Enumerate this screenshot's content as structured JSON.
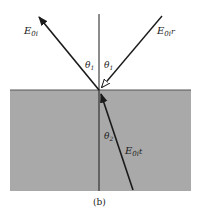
{
  "diagram": {
    "labels": {
      "incident": {
        "main": "E",
        "sub": "0i"
      },
      "reflected": {
        "main": "E",
        "sub": "0r",
        "suffix": "r"
      },
      "transmitted": {
        "main": "E",
        "sub": "0t",
        "suffix": "t"
      },
      "theta_incident": {
        "main": "θ",
        "sub": "1"
      },
      "theta_reflected": {
        "main": "θ",
        "sub": "1"
      },
      "theta_transmitted": {
        "main": "θ",
        "sub": "2"
      }
    },
    "caption": "(b)",
    "colors": {
      "medium": "#a9a9a9",
      "line": "#1a1a1a",
      "background": "#ffffff"
    }
  }
}
